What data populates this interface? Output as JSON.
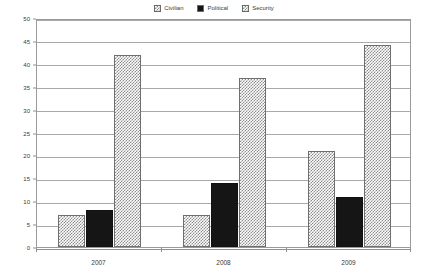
{
  "chart_data": {
    "type": "bar",
    "title": "",
    "xlabel": "",
    "ylabel": "",
    "categories": [
      "2007",
      "2008",
      "2009"
    ],
    "series": [
      {
        "name": "Civilian",
        "values": [
          7,
          7,
          21
        ],
        "pattern": "checkered-grey",
        "color": "#8d8d8d"
      },
      {
        "name": "Political",
        "values": [
          8,
          14,
          11
        ],
        "pattern": "solid-black",
        "color": "#151515"
      },
      {
        "name": "Security",
        "values": [
          42,
          37,
          44
        ],
        "pattern": "checkered-grey",
        "color": "#8d8d8d"
      }
    ],
    "ylim": [
      0,
      50
    ],
    "yticks": [
      0,
      5,
      10,
      15,
      20,
      25,
      30,
      35,
      40,
      45,
      50
    ],
    "ytick_labels": [
      "0",
      "5",
      "10",
      "15",
      "20",
      "25",
      "30",
      "35",
      "40",
      "45",
      "50"
    ],
    "grid": true,
    "grid_axis": "y",
    "legend_position": "top-center",
    "legend_entries": [
      "Civilian",
      "Political",
      "Security"
    ]
  }
}
